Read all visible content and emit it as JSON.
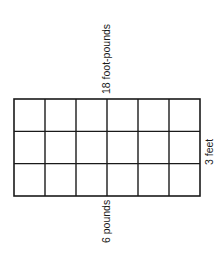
{
  "diagram": {
    "type": "area-model-grid",
    "rows": 3,
    "columns": 6,
    "labels": {
      "top": "18 foot-pounds",
      "bottom": "6 pounds",
      "right": "3 feet"
    },
    "line_color": "#1a1a1a",
    "background": "#ffffff"
  }
}
